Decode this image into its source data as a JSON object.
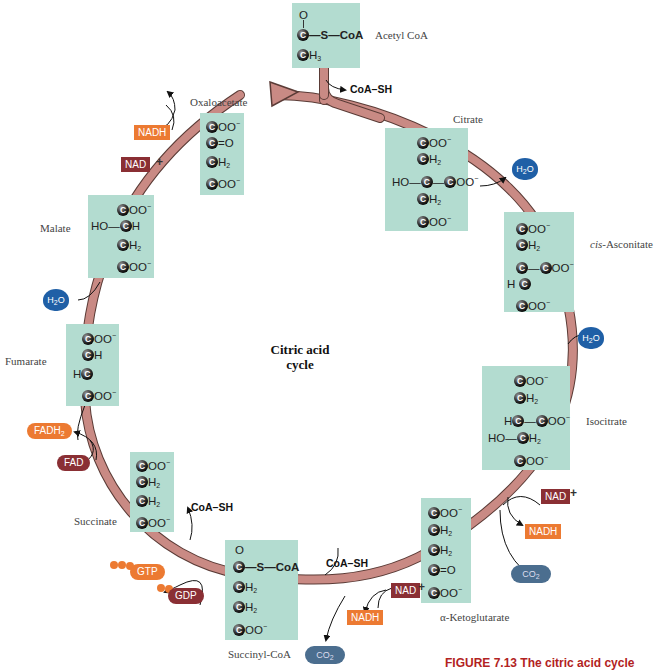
{
  "diagram": {
    "title": "Citric acid cycle",
    "center_label": [
      "Citric acid",
      "cycle"
    ],
    "caption": "FIGURE 7.13  The citric acid cycle",
    "colors": {
      "molecule_box": "#b3dcd0",
      "cycle_arrow": "#c98a84",
      "nadh": "#ec7a32",
      "nad": "#8a2f34",
      "water": "#1f5fa6",
      "co2": "#4b6e8f",
      "caption": "#b22222"
    }
  },
  "molecules": {
    "acetyl_coa": {
      "name": "Acetyl CoA",
      "rows": [
        "O",
        "C—S—CoA",
        "CH3"
      ]
    },
    "citrate": {
      "name": "Citrate",
      "rows": [
        "COO−",
        "CH2",
        "HO—C—COO−",
        "CH2",
        "COO−"
      ]
    },
    "cis_aconitate": {
      "name_italic": "cis",
      "name_rest": "-Asconitate",
      "rows": [
        "COO−",
        "CH2",
        "C—COO−",
        "HC",
        "COO−"
      ]
    },
    "isocitrate": {
      "name": "Isocitrate",
      "rows": [
        "COO−",
        "CH2",
        "HC—COO−",
        "HO—CH2",
        "COO−"
      ]
    },
    "alpha_ketoglutarate": {
      "name": "α-Ketoglutarate",
      "rows": [
        "COO−",
        "CH2",
        "CH2",
        "C=O",
        "COO−"
      ]
    },
    "succinyl_coa": {
      "name": "Succinyl-CoA",
      "rows": [
        "O",
        "C—S—CoA",
        "CH2",
        "CH2",
        "COO−"
      ]
    },
    "succinate": {
      "name": "Succinate",
      "rows": [
        "COO−",
        "CH2",
        "CH2",
        "COO−"
      ]
    },
    "fumarate": {
      "name": "Fumarate",
      "rows": [
        "COO−",
        "CH",
        "HC",
        "COO−"
      ]
    },
    "malate": {
      "name": "Malate",
      "rows": [
        "COO−",
        "HO—CH",
        "CH2",
        "COO−"
      ]
    },
    "oxaloacetate": {
      "name": "Oxaloacetate",
      "rows": [
        "COO−",
        "C=O",
        "CH2",
        "COO−"
      ]
    }
  },
  "cofactors": {
    "coa_sh_top": "CoA–SH",
    "coa_sh_bottom": "CoA–SH",
    "coa_sh_succinate": "CoA–SH",
    "nadh_label": "NADH",
    "nad_label": "NAD",
    "plus": "+",
    "fadh2_label": "FADH",
    "fadh2_sub": "2",
    "fad_label": "FAD",
    "gtp_label": "GTP",
    "gdp_label": "GDP",
    "h2o_label": "H",
    "h2o_sub": "2",
    "h2o_o": "O",
    "co2_label": "CO",
    "co2_sub": "2"
  },
  "text": {
    "C": "C",
    "O": "O",
    "OO": "OO",
    "H": "H",
    "H2": "2",
    "H3": "3",
    "minus": "−",
    "HO": "HO",
    "S_CoA": "—S—CoA",
    "eqO": "=O",
    "dash": "—"
  }
}
